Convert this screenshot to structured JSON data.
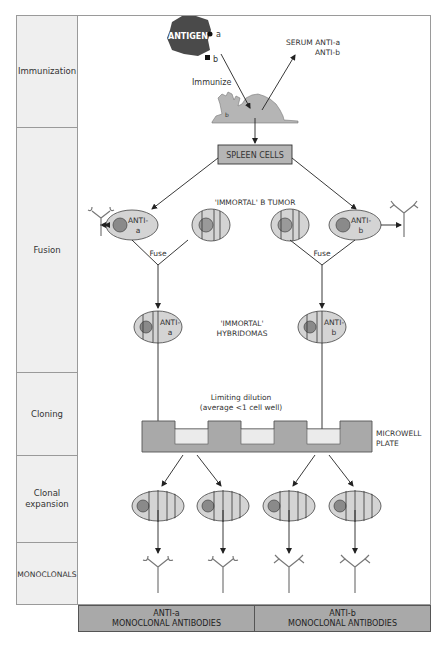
{
  "stages": [
    {
      "label": "Immunization",
      "top": 0,
      "height": 112
    },
    {
      "label": "Fusion",
      "top": 112,
      "height": 245
    },
    {
      "label": "Cloning",
      "top": 357,
      "height": 83
    },
    {
      "label": "Clonal expansion",
      "top": 440,
      "height": 87
    },
    {
      "label": "MONOCLONALS",
      "top": 527,
      "height": 63
    }
  ],
  "immunization": {
    "antigen_label": "ANTIGEN",
    "epitope_a": "a",
    "epitope_b": "b",
    "immunize_label": "Immunize",
    "serum_line1": "SERUM ANTI-a",
    "serum_line2": "ANTI-b",
    "mouse_marker": "b"
  },
  "fusion": {
    "spleen_cells_label": "SPLEEN CELLS",
    "tumor_label": "'IMMORTAL' B TUMOR",
    "anti_a_cell": {
      "line1": "ANTI-",
      "line2": "a"
    },
    "anti_b_cell": {
      "line1": "ANTI-",
      "line2": "b"
    },
    "fuse_label": "Fuse",
    "hybridoma_line1": "'IMMORTAL'",
    "hybridoma_line2": "HYBRIDOMAS",
    "hybridoma_a": {
      "line1": "ANTI-",
      "line2": "a"
    },
    "hybridoma_b": {
      "line1": "ANTI-",
      "line2": "b"
    }
  },
  "cloning": {
    "dilution_line1": "Limiting dilution",
    "dilution_line2": "(average <1 cell well)",
    "plate_line1": "MICROWELL",
    "plate_line2": "PLATE"
  },
  "results": [
    {
      "line1": "ANTI-a",
      "line2": "MONOCLONAL ANTIBODIES"
    },
    {
      "line1": "ANTI-b",
      "line2": "MONOCLONAL ANTIBODIES"
    }
  ],
  "colors": {
    "antigen": "#4a4a4a",
    "cell_fill": "#d4d4d4",
    "nucleus": "#8a8a8a",
    "plate": "#a9a9a9",
    "well": "#ebebeb",
    "stage_bg": "#efefef",
    "band": "#a9a9a9"
  }
}
